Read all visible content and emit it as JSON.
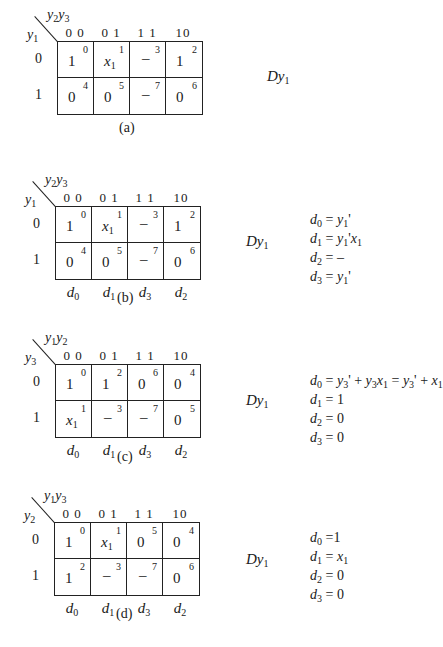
{
  "figures": [
    {
      "id": "a",
      "caption": "(a)",
      "col_var": "y2y3",
      "row_var": "y1",
      "col_headers": [
        "0 0",
        "0 1",
        "1 1",
        "10"
      ],
      "row_headers": [
        "0",
        "1"
      ],
      "cells": [
        [
          {
            "value": "1",
            "index": "0"
          },
          {
            "value": "x1",
            "index": "1"
          },
          {
            "value": "–",
            "index": "3"
          },
          {
            "value": "1",
            "index": "2"
          }
        ],
        [
          {
            "value": "0",
            "index": "4"
          },
          {
            "value": "0",
            "index": "5"
          },
          {
            "value": "–",
            "index": "7"
          },
          {
            "value": "0",
            "index": "6"
          }
        ]
      ],
      "output_label": "Dy1",
      "column_outputs": [],
      "equations": []
    },
    {
      "id": "b",
      "caption": "(b)",
      "col_var": "y2y3",
      "row_var": "y1",
      "col_headers": [
        "0 0",
        "0 1",
        "1 1",
        "10"
      ],
      "row_headers": [
        "0",
        "1"
      ],
      "cells": [
        [
          {
            "value": "1",
            "index": "0"
          },
          {
            "value": "x1",
            "index": "1"
          },
          {
            "value": "–",
            "index": "3"
          },
          {
            "value": "1",
            "index": "2"
          }
        ],
        [
          {
            "value": "0",
            "index": "4"
          },
          {
            "value": "0",
            "index": "5"
          },
          {
            "value": "–",
            "index": "7"
          },
          {
            "value": "0",
            "index": "6"
          }
        ]
      ],
      "output_label": "Dy1",
      "column_outputs": [
        "d0",
        "d1",
        "d3",
        "d2"
      ],
      "equations": [
        "d0 = y1'",
        "d1 = y1'x1",
        "d2 = –",
        "d3 = y1'"
      ]
    },
    {
      "id": "c",
      "caption": "(c)",
      "col_var": "y1y2",
      "row_var": "y3",
      "col_headers": [
        "0 0",
        "0 1",
        "1 1",
        "10"
      ],
      "row_headers": [
        "0",
        "1"
      ],
      "cells": [
        [
          {
            "value": "1",
            "index": "0"
          },
          {
            "value": "1",
            "index": "2"
          },
          {
            "value": "0",
            "index": "6"
          },
          {
            "value": "0",
            "index": "4"
          }
        ],
        [
          {
            "value": "x1",
            "index": "1"
          },
          {
            "value": "–",
            "index": "3"
          },
          {
            "value": "–",
            "index": "7"
          },
          {
            "value": "0",
            "index": "5"
          }
        ]
      ],
      "output_label": "Dy1",
      "column_outputs": [
        "d0",
        "d1",
        "d3",
        "d2"
      ],
      "equations": [
        "d0 = y3' + y3x1 = y3' + x1",
        "d1 = 1",
        "d2 = 0",
        "d3 = 0"
      ]
    },
    {
      "id": "d",
      "caption": "(d)",
      "col_var": "y1y3",
      "row_var": "y2",
      "col_headers": [
        "0 0",
        "0 1",
        "1 1",
        "10"
      ],
      "row_headers": [
        "0",
        "1"
      ],
      "cells": [
        [
          {
            "value": "1",
            "index": "0"
          },
          {
            "value": "x1",
            "index": "1"
          },
          {
            "value": "0",
            "index": "5"
          },
          {
            "value": "0",
            "index": "4"
          }
        ],
        [
          {
            "value": "1",
            "index": "2"
          },
          {
            "value": "–",
            "index": "3"
          },
          {
            "value": "–",
            "index": "7"
          },
          {
            "value": "0",
            "index": "6"
          }
        ]
      ],
      "output_label": "Dy1",
      "column_outputs": [
        "d0",
        "d1",
        "d3",
        "d2"
      ],
      "equations": [
        "d0 =1",
        "d1 = x1",
        "d2 = 0",
        "d3 = 0"
      ]
    }
  ]
}
